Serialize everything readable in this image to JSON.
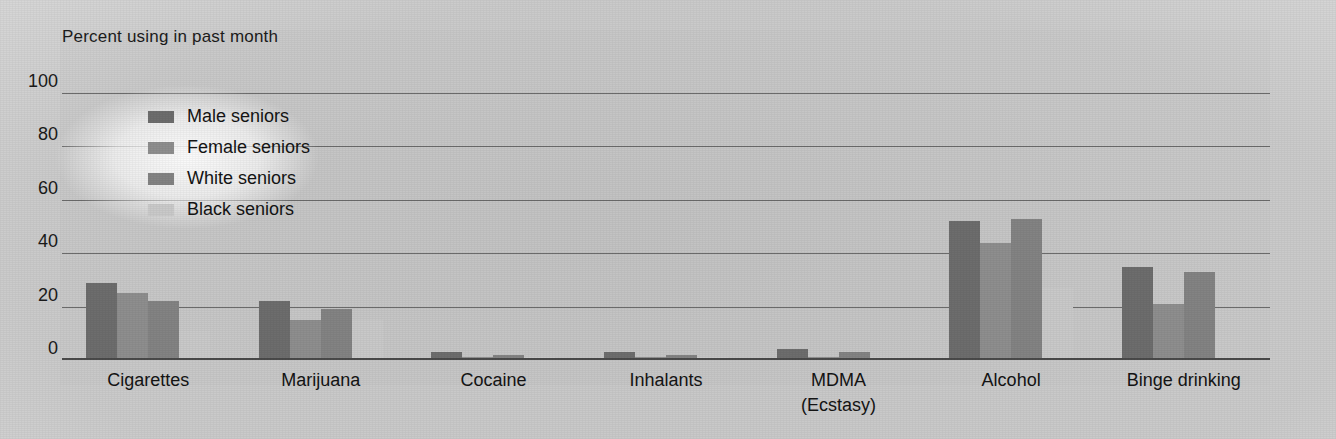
{
  "chart_data": {
    "type": "bar",
    "title": "Percent using in past month",
    "xlabel": "",
    "ylabel": "Percent using in past month",
    "ylim": [
      0,
      100
    ],
    "yticks": [
      100,
      80,
      60,
      40,
      20,
      0
    ],
    "grid": true,
    "legend_position": "upper-left-inside",
    "categories": [
      "Cigarettes",
      "Marijuana",
      "Cocaine",
      "Inhalants",
      "MDMA (Ecstasy)",
      "Alcohol",
      "Binge drinking"
    ],
    "category_labels": [
      {
        "line1": "Cigarettes",
        "line2": ""
      },
      {
        "line1": "Marijuana",
        "line2": ""
      },
      {
        "line1": "Cocaine",
        "line2": ""
      },
      {
        "line1": "Inhalants",
        "line2": ""
      },
      {
        "line1": "MDMA",
        "line2": "(Ecstasy)"
      },
      {
        "line1": "Alcohol",
        "line2": ""
      },
      {
        "line1": "Binge drinking",
        "line2": ""
      }
    ],
    "series": [
      {
        "name": "Male seniors",
        "color": "#6d6d6d",
        "values": [
          29,
          22,
          3,
          3,
          4,
          52,
          35
        ]
      },
      {
        "name": "Female seniors",
        "color": "#8e8e8e",
        "values": [
          25,
          15,
          1,
          1,
          1,
          44,
          21
        ]
      },
      {
        "name": "White seniors",
        "color": "#838383",
        "values": [
          22,
          19,
          2,
          2,
          3,
          53,
          33
        ]
      },
      {
        "name": "Black seniors",
        "color": "#c9c9c9",
        "values": [
          11,
          15,
          1,
          1,
          1,
          27,
          9
        ]
      }
    ]
  }
}
